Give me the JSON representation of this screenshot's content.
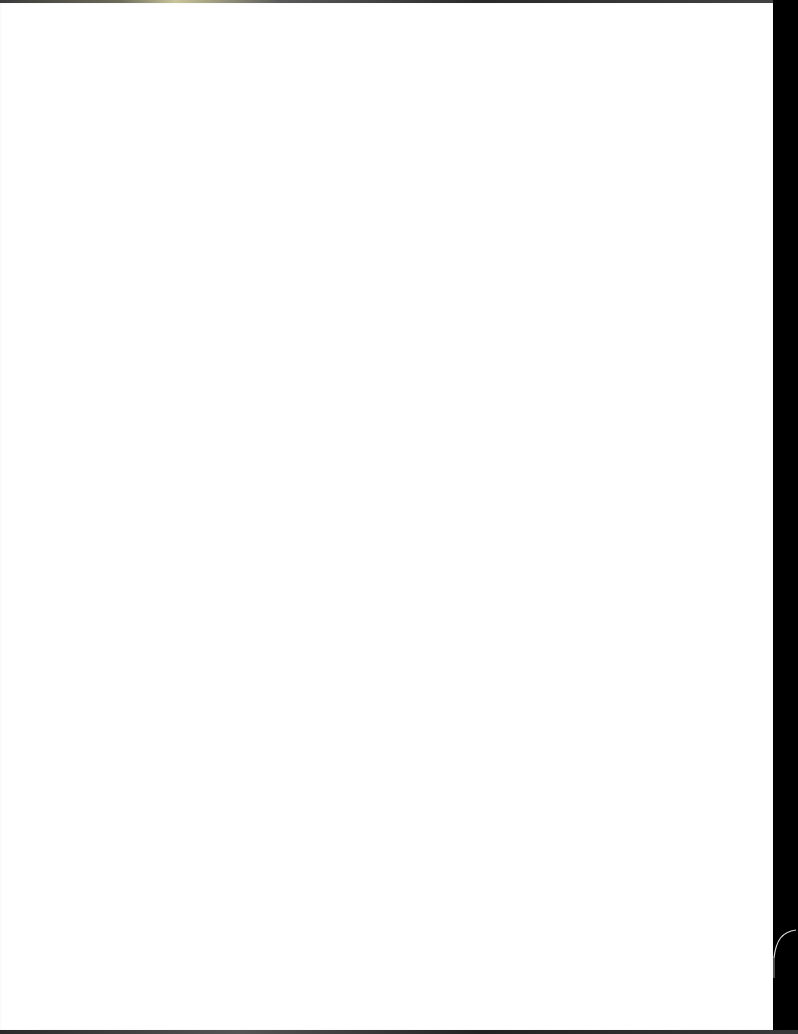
{
  "document": {
    "page_background": "#ffffff",
    "scan_background": "#000000",
    "content": []
  },
  "artifacts": {
    "right_margin": "dark scan border",
    "curl_mark": "paper curl near bottom right"
  }
}
